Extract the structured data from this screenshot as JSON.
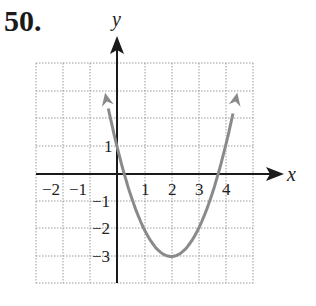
{
  "problem_number": "50.",
  "chart_data": {
    "type": "line",
    "title": "",
    "function": "y = x^2 - 4x + 1",
    "vertex": [
      2,
      -3
    ],
    "y_intercept": 1,
    "x_intercepts": [
      0.27,
      3.73
    ],
    "x": [
      -0.3,
      0,
      0.5,
      1,
      1.5,
      2,
      2.5,
      3,
      3.5,
      4,
      4.3
    ],
    "series": [
      {
        "name": "parabola",
        "values": [
          2.29,
          1,
          -0.75,
          -2,
          -2.75,
          -3,
          -2.75,
          -2,
          -0.75,
          1,
          2.29
        ]
      }
    ],
    "xlabel": "x",
    "ylabel": "y",
    "xlim": [
      -3,
      5
    ],
    "ylim": [
      -4,
      4
    ],
    "x_tick_labels": [
      "-2",
      "-1",
      "1",
      "2",
      "3",
      "4"
    ],
    "y_tick_labels": [
      "1",
      "-1",
      "-2",
      "-3"
    ],
    "grid": true,
    "curve_color": "#8a8a8a",
    "axis_color": "#1a1a1a",
    "grid_color": "#9a9a9a"
  },
  "labels": {
    "x_axis": "x",
    "y_axis": "y",
    "xt_m2": "−2",
    "xt_m1": "−1",
    "xt_1": "1",
    "xt_2": "2",
    "xt_3": "3",
    "xt_4": "4",
    "yt_1": "1",
    "yt_m1": "−1",
    "yt_m2": "−2",
    "yt_m3": "−3"
  }
}
